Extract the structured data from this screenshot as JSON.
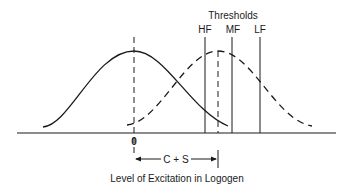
{
  "diagram": {
    "thresholds_label": "Thresholds",
    "threshold_lines": [
      {
        "label": "HF"
      },
      {
        "label": "MF"
      },
      {
        "label": "LF"
      }
    ],
    "zero_label": "0",
    "distance_label": "C + S",
    "xlabel": "Level of Excitation in Logogen",
    "curves": [
      {
        "name": "noise-distribution",
        "style": "solid"
      },
      {
        "name": "signal-plus-noise-distribution",
        "style": "dashed"
      }
    ],
    "colors": {
      "ink": "#1a1a1a",
      "background": "#ffffff"
    }
  }
}
